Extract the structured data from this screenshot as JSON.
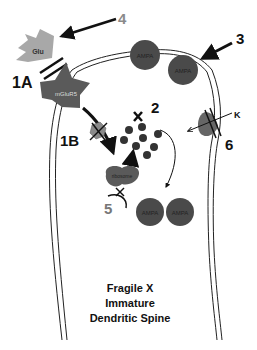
{
  "labels": {
    "l1a": "1A",
    "l1b": "1B",
    "l2": "2",
    "l3": "3",
    "l4": "4",
    "l5": "5",
    "l6": "6",
    "k": "K",
    "x": "X"
  },
  "molecules": {
    "glu": "Glu",
    "mglur5": "mGluR5",
    "ribosome": "ribosome",
    "ampa": "AMPA"
  },
  "caption": {
    "line1": "Fragile X",
    "line2": "Immature",
    "line3": "Dendritic Spine"
  },
  "colors": {
    "dark": "#4a4a4a",
    "medium": "#6e6e6e",
    "light": "#a8a8a8",
    "gray_label": "#8a8a8a",
    "black": "#111111"
  }
}
